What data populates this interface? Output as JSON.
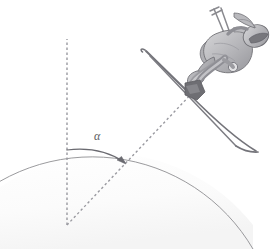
{
  "figure": {
    "background_color": "#ffffff",
    "dome_fill_color": "#fafafa",
    "dome_stroke_color": "#8c8c90",
    "dashed_line_color": "#9a9aa0",
    "arrow_color": "#6a6a70",
    "figure_outline_color": "#6f6f74",
    "figure_fill_light": "#cfcfd1",
    "figure_fill_mid": "#a9a9ad",
    "figure_fill_dark": "#7b7b80",
    "boot_color": "#6e6e73",
    "ski_color": "#6a6a70",
    "pole_color": "#8a8a8f"
  },
  "labels": {
    "angle_symbol": "α"
  },
  "geometry": {
    "circle_center_x": 67,
    "circle_center_y": 225,
    "circle_radius": 186,
    "vertical_radius_top_x": 67,
    "vertical_radius_top_y": 39,
    "skier_radius_end_x": 194,
    "skier_radius_end_y": 91,
    "angle_degrees": 45,
    "angle_arc_start_x": 67,
    "angle_arc_start_y": 150,
    "angle_arrow_tip_x": 125,
    "angle_arrow_tip_y": 163,
    "angle_label_x": 95,
    "angle_label_y": 133
  }
}
